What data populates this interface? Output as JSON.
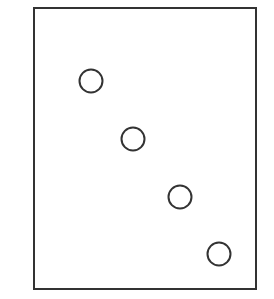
{
  "figure": {
    "title": "",
    "background_color": "#ffffff",
    "width": 274,
    "height": 299
  },
  "frame": {
    "name": "plot-frame",
    "x": 34,
    "y": 8,
    "width": 222,
    "height": 281,
    "stroke_color": "#333333",
    "stroke_width": 2,
    "fill_color": "#ffffff"
  },
  "marker_style": {
    "shape": "open-circle",
    "radius": 11.5,
    "stroke_color": "#333333",
    "stroke_width": 2,
    "fill_color": "#ffffff"
  },
  "chart_data": {
    "type": "scatter",
    "title": "",
    "xlabel": "",
    "ylabel": "",
    "xlim": [
      34,
      256
    ],
    "ylim": [
      8,
      289
    ],
    "grid": false,
    "legend": null,
    "axis_ticks": false,
    "tick_labels": [],
    "annotations": [],
    "series": [
      {
        "name": "points",
        "marker": "open-circle",
        "color": "#333333",
        "x": [
          91,
          133,
          180,
          219
        ],
        "y": [
          81,
          139,
          197,
          254
        ],
        "points": [
          {
            "label": "point-1",
            "x": 91,
            "y": 81,
            "r": 11.5
          },
          {
            "label": "point-2",
            "x": 133,
            "y": 139,
            "r": 11.5
          },
          {
            "label": "point-3",
            "x": 180,
            "y": 197,
            "r": 11.5
          },
          {
            "label": "point-4",
            "x": 219,
            "y": 254,
            "r": 11.5
          }
        ]
      }
    ]
  }
}
